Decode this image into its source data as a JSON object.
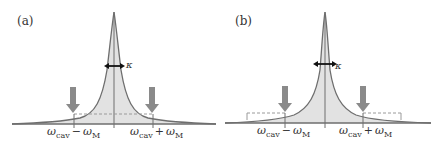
{
  "panels": [
    {
      "id": "a",
      "label": "(a)",
      "kappa_label": "κ",
      "left_label": {
        "sym": "ω",
        "sub": "cav",
        "op": "−",
        "sym2": "ω",
        "sub2": "M"
      },
      "right_label": {
        "sym": "ω",
        "sub": "cav",
        "op": "+",
        "sym2": "ω",
        "sub2": "M"
      },
      "dashed_style": "inner"
    },
    {
      "id": "b",
      "label": "(b)",
      "kappa_label": "κ",
      "left_label": {
        "sym": "ω",
        "sub": "cav",
        "op": "−",
        "sym2": "ω",
        "sub2": "M"
      },
      "right_label": {
        "sym": "ω",
        "sub": "cav",
        "op": "+",
        "sym2": "ω",
        "sub2": "M"
      },
      "dashed_style": "outer"
    }
  ],
  "colors": {
    "curve": "#6e6e6e",
    "fill": "#e2e2e2",
    "arrow": "#8a8a8a",
    "axis": "#6e6e6e",
    "dashed": "#9a9a9a",
    "kappa_arrow": "#111111"
  }
}
